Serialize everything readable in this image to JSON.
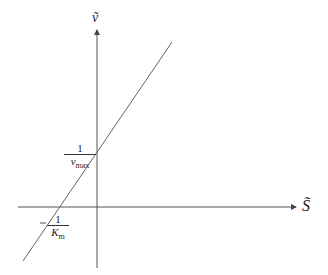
{
  "diagram": {
    "type": "Lineweaver-Burk style plot",
    "axes": {
      "x_label": "S̃",
      "y_label": "ṽ"
    },
    "annotations": {
      "y_intercept": {
        "numerator": "1",
        "denominator": "v",
        "denominator_sub": "max"
      },
      "x_intercept": {
        "numerator": "1",
        "denominator": "K",
        "denominator_sub": "m"
      }
    },
    "colors": {
      "line": "#555555",
      "axis": "#555555",
      "text": "#222222"
    }
  }
}
